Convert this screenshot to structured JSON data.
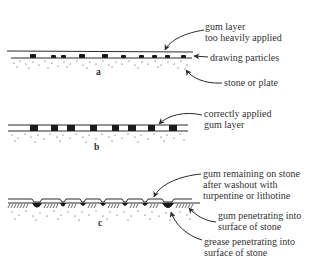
{
  "diagrams": [
    {
      "id": "a",
      "letter": "a",
      "labels": {
        "gum_layer_line1": "gum layer",
        "gum_layer_line2": "too heavily applied",
        "drawing_particles": "drawing particles",
        "stone_or_plate": "stone or plate"
      }
    },
    {
      "id": "b",
      "letter": "b",
      "labels": {
        "correct_line1": "correctly applied",
        "correct_line2": "gum layer"
      }
    },
    {
      "id": "c",
      "letter": "c",
      "labels": {
        "remaining_line1": "gum remaining on stone",
        "remaining_line2": "after washout with",
        "remaining_line3": "turpentine or lithotine",
        "gum_pen_line1": "gum penetrating into",
        "gum_pen_line2": "surface of stone",
        "grease_pen_line1": "grease penetrating into",
        "grease_pen_line2": "surface of stone"
      }
    }
  ],
  "colors": {
    "ink": "#2a2a2a",
    "background": "#ffffff"
  }
}
